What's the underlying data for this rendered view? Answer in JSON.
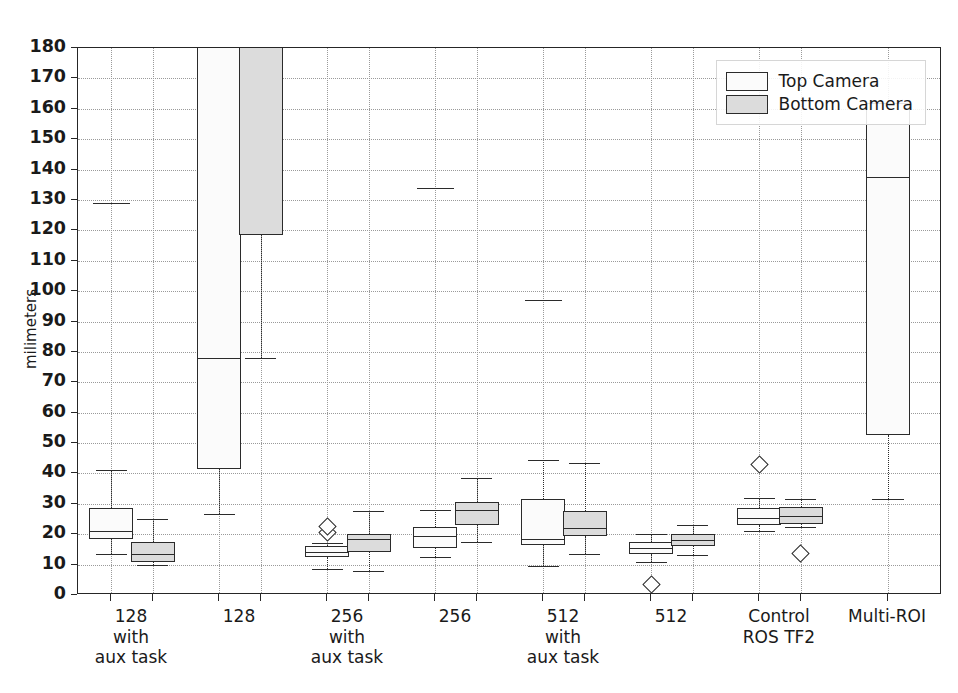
{
  "chart_data": {
    "type": "box",
    "title": "",
    "xlabel": "",
    "ylabel": "milimeters",
    "ylim": [
      0,
      180
    ],
    "yticks": [
      0,
      10,
      20,
      30,
      40,
      50,
      60,
      70,
      80,
      90,
      100,
      110,
      120,
      130,
      140,
      150,
      160,
      170,
      180
    ],
    "grid": true,
    "legend_position": "upper right",
    "legend": [
      {
        "name": "Top Camera",
        "fill": "#fbfbfb"
      },
      {
        "name": "Bottom Camera",
        "fill": "#dcdcdc"
      }
    ],
    "categories": [
      "128\nwith\naux task",
      "128",
      "256\nwith\naux task",
      "256",
      "512\nwith\naux task",
      "512",
      "Control\nROS TF2",
      "Multi-ROI"
    ],
    "series": [
      {
        "name": "Top Camera",
        "boxes": [
          {
            "whisker_low": 13.5,
            "q1": 18.5,
            "median": 21.0,
            "q3": 28.5,
            "whisker_high": 41.0,
            "fliers": [
              129.0
            ],
            "clipped_top": false
          },
          {
            "whisker_low": 26.5,
            "q1": 41.5,
            "median": 78.0,
            "q3": 192.0,
            "whisker_high": 192.0,
            "fliers": [],
            "clipped_top": true
          },
          {
            "whisker_low": 8.5,
            "q1": 12.5,
            "median": 14.0,
            "q3": 16.0,
            "whisker_high": 17.0,
            "fliers": [
              20.5,
              22.5
            ],
            "clipped_top": false
          },
          {
            "whisker_low": 12.5,
            "q1": 15.5,
            "median": 19.5,
            "q3": 22.5,
            "whisker_high": 28.0,
            "fliers": [
              134.0
            ],
            "clipped_top": false
          },
          {
            "whisker_low": 9.5,
            "q1": 16.5,
            "median": 18.5,
            "q3": 31.5,
            "whisker_high": 44.5,
            "fliers": [
              97.0
            ],
            "clipped_top": false
          },
          {
            "whisker_low": 11.0,
            "q1": 13.5,
            "median": 15.5,
            "q3": 17.5,
            "whisker_high": 20.0,
            "fliers": [
              3.5
            ],
            "clipped_top": false
          },
          {
            "whisker_low": 21.0,
            "q1": 23.0,
            "median": 25.5,
            "q3": 28.5,
            "whisker_high": 32.0,
            "fliers": [
              43.0
            ],
            "clipped_top": false
          },
          {
            "whisker_low": 31.5,
            "q1": 52.5,
            "median": 137.5,
            "q3": 162.0,
            "whisker_high": 162.0,
            "fliers": [],
            "clipped_top": false
          }
        ]
      },
      {
        "name": "Bottom Camera",
        "boxes": [
          {
            "whisker_low": 10.0,
            "q1": 11.0,
            "median": 13.5,
            "q3": 17.5,
            "whisker_high": 25.0,
            "fliers": [],
            "clipped_top": false
          },
          {
            "whisker_low": 78.0,
            "q1": 118.5,
            "median": 192.0,
            "q3": 192.0,
            "whisker_high": 192.0,
            "fliers": [],
            "clipped_top": true
          },
          {
            "whisker_low": 8.0,
            "q1": 14.0,
            "median": 18.5,
            "q3": 20.0,
            "whisker_high": 27.5,
            "fliers": [],
            "clipped_top": false
          },
          {
            "whisker_low": 17.5,
            "q1": 23.0,
            "median": 28.0,
            "q3": 30.5,
            "whisker_high": 38.5,
            "fliers": [],
            "clipped_top": false
          },
          {
            "whisker_low": 13.5,
            "q1": 19.5,
            "median": 22.0,
            "q3": 27.5,
            "whisker_high": 43.5,
            "fliers": [],
            "clipped_top": false
          },
          {
            "whisker_low": 13.0,
            "q1": 16.0,
            "median": 18.0,
            "q3": 20.0,
            "whisker_high": 23.0,
            "fliers": [],
            "clipped_top": false
          },
          {
            "whisker_low": 22.5,
            "q1": 23.5,
            "median": 26.0,
            "q3": 29.0,
            "whisker_high": 31.5,
            "fliers": [
              13.5
            ],
            "clipped_top": false
          },
          null
        ]
      }
    ]
  }
}
